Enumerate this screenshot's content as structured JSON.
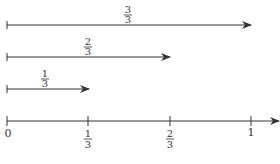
{
  "diagram": {
    "type": "number-line-fractions",
    "axis": {
      "ticks": [
        {
          "label": "0",
          "value": 0
        },
        {
          "label_num": "1",
          "label_den": "3",
          "value": 0.3333
        },
        {
          "label_num": "2",
          "label_den": "3",
          "value": 0.6667
        },
        {
          "label": "1",
          "value": 1
        }
      ]
    },
    "arrows": [
      {
        "num": "3",
        "den": "3",
        "length": 1
      },
      {
        "num": "2",
        "den": "3",
        "length": 0.6667
      },
      {
        "num": "1",
        "den": "3",
        "length": 0.3333
      }
    ],
    "colors": {
      "line": "#333333"
    }
  }
}
